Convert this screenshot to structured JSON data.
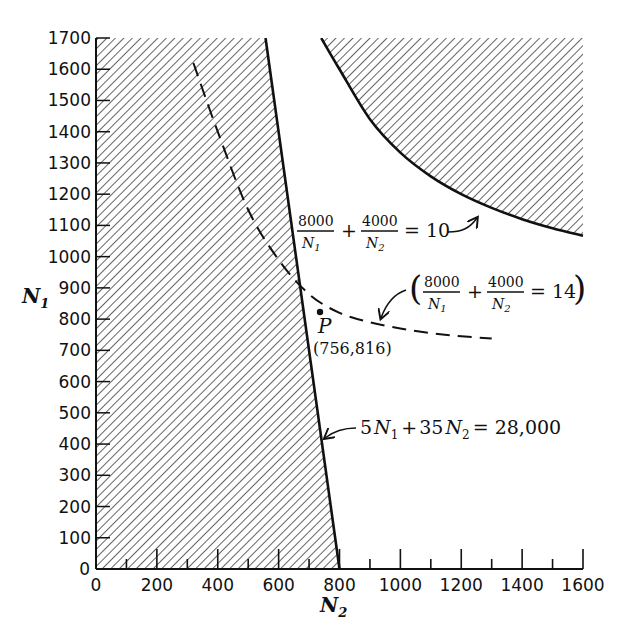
{
  "chart_data": {
    "type": "line",
    "title": "",
    "xlabel": "N2",
    "ylabel": "N1",
    "xlim": [
      0,
      1600
    ],
    "ylim": [
      0,
      1700
    ],
    "x_ticks": [
      "0",
      "200",
      "400",
      "600",
      "800",
      "1000",
      "1200",
      "1400",
      "1600"
    ],
    "y_ticks": [
      "0",
      "100",
      "200",
      "300",
      "400",
      "500",
      "600",
      "700",
      "800",
      "900",
      "1000",
      "1100",
      "1200",
      "1300",
      "1400",
      "1500",
      "1600",
      "1700"
    ],
    "grid": false,
    "series": [
      {
        "name": "5N1 + 35N2 = 28,000",
        "style": "solid",
        "points": [
          [
            557,
            1700
          ],
          [
            800,
            0
          ]
        ],
        "shaded_side": "left"
      },
      {
        "name": "8000/N1 + 4000/N2 = 10",
        "style": "solid",
        "points": [
          [
            740,
            1700
          ],
          [
            800,
            1600
          ],
          [
            900,
            1440
          ],
          [
            1000,
            1333
          ],
          [
            1100,
            1257
          ],
          [
            1200,
            1200
          ],
          [
            1300,
            1156
          ],
          [
            1400,
            1120
          ],
          [
            1500,
            1091
          ],
          [
            1600,
            1067
          ]
        ],
        "shaded_side": "upper-right"
      },
      {
        "name": "8000/N1 + 4000/N2 = 14",
        "style": "dashed",
        "points": [
          [
            320,
            1620
          ],
          [
            400,
            1400
          ],
          [
            500,
            1150
          ],
          [
            600,
            990
          ],
          [
            700,
            880
          ],
          [
            800,
            820
          ],
          [
            900,
            790
          ],
          [
            1000,
            770
          ],
          [
            1100,
            755
          ],
          [
            1200,
            745
          ],
          [
            1300,
            738
          ]
        ]
      }
    ],
    "annotations": [
      {
        "label": "P",
        "coords": "(756,816)",
        "x": 756,
        "y": 816
      },
      {
        "text": "8000/N1 + 4000/N2 = 10"
      },
      {
        "text": "(8000/N1 + 4000/N2 = 14)"
      },
      {
        "text": "5N1 + 35N2 = 28,000"
      }
    ]
  },
  "labels": {
    "x_axis": "N",
    "x_axis_sub": "2",
    "y_axis": "N",
    "y_axis_sub": "1",
    "point_name": "P",
    "point_coords": "(756,816)",
    "curve10": {
      "num1": "8000",
      "den1": "N",
      "den1_sub": "1",
      "plus": "+",
      "num2": "4000",
      "den2": "N",
      "den2_sub": "2",
      "rhs": "= 10"
    },
    "curve14": {
      "open": "(",
      "num1": "8000",
      "den1": "N",
      "den1_sub": "1",
      "plus": "+",
      "num2": "4000",
      "den2": "N",
      "den2_sub": "2",
      "rhs": "= 14",
      "close": ")"
    },
    "line": {
      "a": "5",
      "v1": "N",
      "v1_sub": "1",
      "plus": "+",
      "b": "35",
      "v2": "N",
      "v2_sub": "2",
      "rhs": "= 28,000"
    }
  }
}
